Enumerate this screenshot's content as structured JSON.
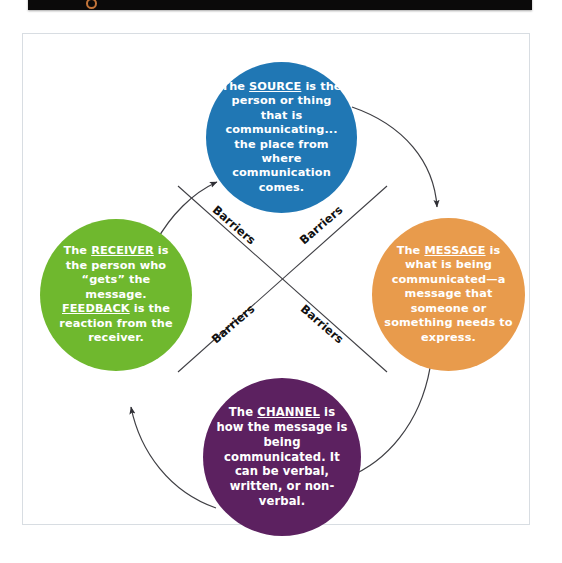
{
  "top_bar": {
    "glyph": "circle-glyph-icon"
  },
  "diagram": {
    "nodes": [
      {
        "id": "source",
        "key_term": "SOURCE",
        "color": "#2077b4",
        "text_before": "The ",
        "text_after": " is the person or thing that is communicating... the place from where communication comes."
      },
      {
        "id": "message",
        "key_term": "MESSAGE",
        "color": "#e89b4c",
        "text_before": "The ",
        "text_after": " is what is being communicated—a message that someone or something needs to express."
      },
      {
        "id": "channel",
        "key_term": "CHANNEL",
        "color": "#5c2160",
        "text_before": "The ",
        "text_after": " is how the message is being communicated. It can be verbal, written, or non-verbal."
      },
      {
        "id": "receiver",
        "key_term": "RECEIVER",
        "key_term_2": "FEEDBACK",
        "color": "#6fb82e",
        "text_before": "The ",
        "text_middle": " is the person who “gets” the message. ",
        "text_after": " is the reaction from the receiver."
      }
    ],
    "barriers": [
      {
        "id": "barrier-top-left",
        "label": "Barriers"
      },
      {
        "id": "barrier-top-right",
        "label": "Barriers"
      },
      {
        "id": "barrier-bottom-left",
        "label": "Barriers"
      },
      {
        "id": "barrier-bottom-right",
        "label": "Barriers"
      }
    ],
    "arrows": [
      {
        "id": "receiver-to-source",
        "from": "receiver",
        "to": "source"
      },
      {
        "id": "source-to-message",
        "from": "source",
        "to": "message"
      },
      {
        "id": "message-to-channel",
        "from": "message",
        "to": "channel"
      },
      {
        "id": "channel-to-receiver",
        "from": "channel",
        "to": "receiver"
      }
    ],
    "colors": {
      "arrow": "#3f3f44",
      "barrier_line": "#3f3f44",
      "text": "#ffffff",
      "page_border": "#d8dde2"
    }
  }
}
